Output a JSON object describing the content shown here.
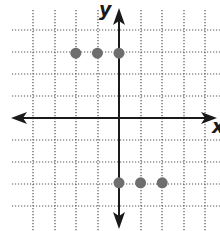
{
  "chart_data": {
    "type": "scatter",
    "title": "",
    "xlabel": "x",
    "ylabel": "y",
    "xlim": [
      -5,
      4
    ],
    "ylim": [
      -4,
      5
    ],
    "grid": true,
    "grid_style": "dotted",
    "points": [
      {
        "x": -2,
        "y": 3
      },
      {
        "x": -1,
        "y": 3
      },
      {
        "x": 0,
        "y": 3
      },
      {
        "x": 0,
        "y": -3
      },
      {
        "x": 1,
        "y": -3
      },
      {
        "x": 2,
        "y": -3
      }
    ],
    "colors": {
      "point": "#6e6e6e",
      "axis": "#1a1a1a",
      "grid": "#555555"
    }
  },
  "labels": {
    "x_axis": "x",
    "y_axis": "y"
  },
  "layout": {
    "origin_px": [
      119,
      118
    ],
    "unit_px": 21.6,
    "grid_x_px": [
      33,
      55,
      76,
      98,
      119,
      141,
      162,
      184,
      205
    ],
    "grid_y_px": [
      30,
      52,
      74,
      96,
      118,
      140,
      162,
      184,
      206
    ]
  }
}
